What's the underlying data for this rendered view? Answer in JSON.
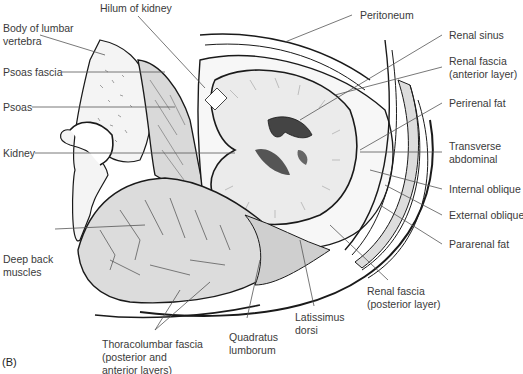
{
  "figure": {
    "panel_label": "(B)"
  },
  "labels": {
    "hilum": "Hilum of kidney",
    "body_vertebra_1": "Body of lumbar",
    "body_vertebra_2": "vertebra",
    "psoas_fascia": "Psoas fascia",
    "psoas": "Psoas",
    "kidney": "Kidney",
    "deep_back_1": "Deep back",
    "deep_back_2": "muscles",
    "thoraco_1": "Thoracolumbar fascia",
    "thoraco_2": "(posterior and",
    "thoraco_3": "anterior layers)",
    "quadratus_1": "Quadratus",
    "quadratus_2": "lumborum",
    "latissimus_1": "Latissimus",
    "latissimus_2": "dorsi",
    "renal_post_1": "Renal fascia",
    "renal_post_2": "(posterior layer)",
    "peritoneum": "Peritoneum",
    "renal_sinus": "Renal sinus",
    "renal_ant_1": "Renal fascia",
    "renal_ant_2": "(anterior layer)",
    "perirenal": "Perirenal fat",
    "transverse_1": "Transverse",
    "transverse_2": "abdominal",
    "internal": "Internal oblique",
    "external": "External oblique",
    "pararenal": "Pararenal fat"
  },
  "colors": {
    "line": "#1a1a1a",
    "leader": "#555555",
    "shade": "#d9d9d9",
    "light_shade": "#ececec",
    "text": "#3a3a3a"
  }
}
